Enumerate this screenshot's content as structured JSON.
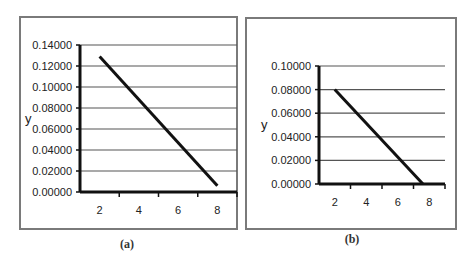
{
  "chart_data": [
    {
      "panel": "a",
      "type": "line",
      "title": "",
      "caption": "(a)",
      "xlabel": "",
      "ylabel": "y",
      "x_ticks": [
        "2",
        "4",
        "6",
        "8"
      ],
      "y_ticks": [
        "0.00000",
        "0.02000",
        "0.04000",
        "0.06000",
        "0.08000",
        "0.10000",
        "0.12000",
        "0.14000"
      ],
      "xlim": [
        1,
        9
      ],
      "ylim": [
        0,
        0.14
      ],
      "grid": "horizontal",
      "legend": "none",
      "series": [
        {
          "name": "y",
          "x": [
            2,
            8
          ],
          "values": [
            0.129,
            0.006
          ]
        }
      ]
    },
    {
      "panel": "b",
      "type": "line",
      "title": "",
      "caption": "(b)",
      "xlabel": "",
      "ylabel": "y",
      "x_ticks": [
        "2",
        "4",
        "6",
        "8"
      ],
      "y_ticks": [
        "0.00000",
        "0.02000",
        "0.04000",
        "0.06000",
        "0.08000",
        "0.10000"
      ],
      "xlim": [
        1,
        9
      ],
      "ylim": [
        0,
        0.1
      ],
      "grid": "horizontal",
      "legend": "none",
      "series": [
        {
          "name": "y",
          "x": [
            2,
            7.6
          ],
          "values": [
            0.08,
            0.0
          ]
        }
      ]
    }
  ],
  "layout": {
    "panels": [
      {
        "frame": [
          20,
          17,
          217,
          212
        ],
        "plot": [
          80,
          45,
          157,
          147
        ],
        "caption_xy": [
          127,
          248
        ]
      },
      {
        "frame": [
          246,
          18,
          210,
          211
        ],
        "plot": [
          319,
          66,
          126,
          118
        ],
        "caption_xy": [
          352,
          243
        ]
      }
    ],
    "colors": {
      "frame": "#7a7a7a",
      "grid": "#555555",
      "axis": "#111111",
      "line": "#111111"
    }
  }
}
